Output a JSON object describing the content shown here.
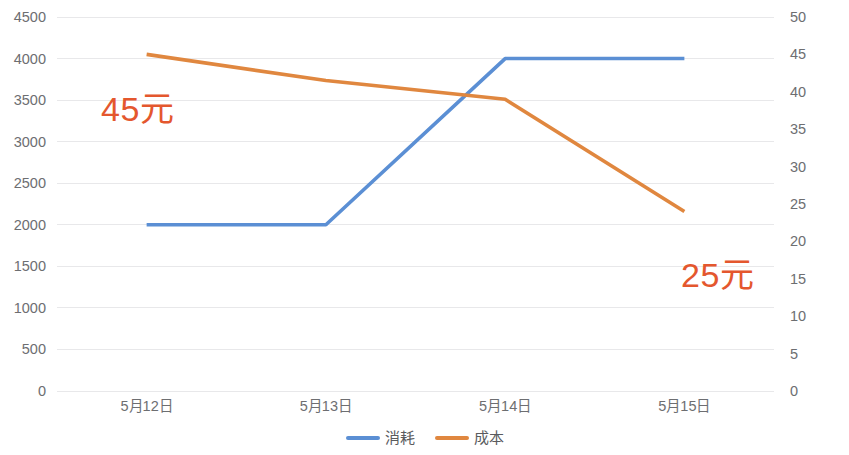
{
  "chart_data": {
    "type": "line",
    "title": "",
    "subtitle": "",
    "xlabel": "",
    "ylabel": "",
    "grid": true,
    "legend_position": "bottom",
    "categories": [
      "5月12日",
      "5月13日",
      "5月14日",
      "5月15日"
    ],
    "axes": {
      "left": {
        "name": "消耗",
        "min": 0,
        "max": 4500,
        "step": 500,
        "ticks": [
          "0",
          "500",
          "1000",
          "1500",
          "2000",
          "2500",
          "3000",
          "3500",
          "4000",
          "4500"
        ],
        "tick_values": [
          0,
          500,
          1000,
          1500,
          2000,
          2500,
          3000,
          3500,
          4000,
          4500
        ]
      },
      "right": {
        "name": "成本",
        "min": 0,
        "max": 50,
        "step": 5,
        "ticks": [
          "0",
          "5",
          "10",
          "15",
          "20",
          "25",
          "30",
          "35",
          "40",
          "45",
          "50"
        ],
        "tick_values": [
          0,
          5,
          10,
          15,
          20,
          25,
          30,
          35,
          40,
          45,
          50
        ]
      }
    },
    "series": [
      {
        "name": "消耗",
        "axis": "left",
        "color": "#5b8fd4",
        "values": [
          2000,
          2000,
          4000,
          4000
        ]
      },
      {
        "name": "成本",
        "axis": "right",
        "color": "#e0873f",
        "values": [
          45,
          41.5,
          39,
          24
        ]
      }
    ],
    "annotations": [
      {
        "text": "45元",
        "color": "#e4572e"
      },
      {
        "text": "25元",
        "color": "#e4572e"
      }
    ]
  },
  "legend": {
    "items": [
      {
        "label": "消耗",
        "color": "#5b8fd4"
      },
      {
        "label": "成本",
        "color": "#e0873f"
      }
    ]
  },
  "colors": {
    "series_consumption": "#5b8fd4",
    "series_cost": "#e0873f",
    "annotation": "#e4572e",
    "gridline": "#e8e8ea",
    "tick_text": "#6d6e71",
    "background": "#ffffff"
  }
}
